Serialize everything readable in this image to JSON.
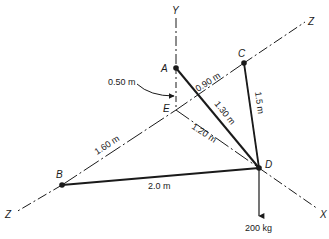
{
  "diagram": {
    "colors": {
      "line": "#1a1a1a",
      "background": "#ffffff"
    },
    "axes": {
      "y_label": "Y",
      "z_label_top": "Z",
      "z_label_bottom": "Z",
      "x_label": "X"
    },
    "points": {
      "A": "A",
      "B": "B",
      "C": "C",
      "D": "D",
      "E": "E"
    },
    "dimensions": {
      "AE_offset": "0.50 m",
      "EC": "0.90 m",
      "AD": "1.30 m",
      "CD": "1.5 m",
      "BE": "1.60 m",
      "ED": "1.20 m",
      "BD": "2.0 m"
    },
    "load": "200 kg"
  }
}
